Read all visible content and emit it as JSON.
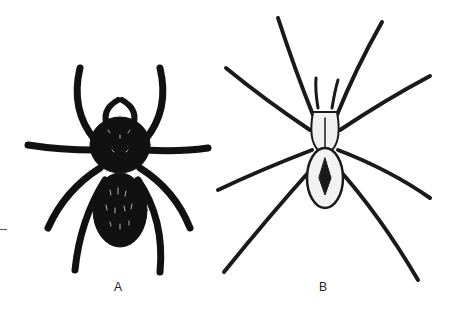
{
  "figure": {
    "panels": [
      {
        "id": "A",
        "label": "A",
        "subject": "stout hairy spider, dorsal view, dark body"
      },
      {
        "id": "B",
        "label": "B",
        "subject": "long-legged wolf/nursery-web spider, dorsal view, pale cephalothorax with dark median band"
      }
    ]
  }
}
